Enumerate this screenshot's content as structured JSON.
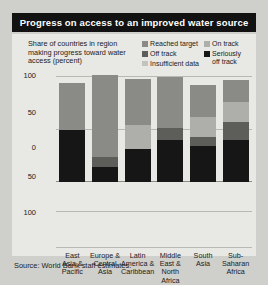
{
  "title": "Progress on access to an improved water source",
  "subtitle": "Share of countries in region making progress toward water access (percent)",
  "source": "Source: World Bank staff estimates.",
  "legend": {
    "left": [
      {
        "label": "Reached target",
        "key": "reached_target",
        "color": "#8a8a86"
      },
      {
        "label": "Off track",
        "key": "off_track",
        "color": "#5d5d5a"
      },
      {
        "label": "Insufficient data",
        "key": "insufficient_data",
        "color": "#c2c2be"
      }
    ],
    "right": [
      {
        "label": "On track",
        "key": "on_track",
        "color": "#aeaeaa"
      },
      {
        "label": "Seriously\noff track",
        "key": "seriously_off_track",
        "color": "#161616"
      }
    ]
  },
  "axis": {
    "ticks": [
      "100",
      "50",
      "0",
      "50",
      "100"
    ],
    "unit": "percent"
  },
  "chart_data": {
    "type": "bar",
    "title": "Progress on access to an improved water source",
    "subtitle": "Share of countries in region making progress toward water access (percent)",
    "xlabel": "",
    "ylabel": "Share of countries in region making progress toward water access (percent)",
    "ylim": [
      0,
      100
    ],
    "ytick_labels": [
      "100",
      "50",
      "0",
      "50",
      "100"
    ],
    "grid": true,
    "stacked": true,
    "legend_position": "top-right",
    "categories": [
      "East Asia & Pacific",
      "Europe & Central Asia",
      "Latin America & Caribbean",
      "Middle East & North Africa",
      "South Asia",
      "Sub-Saharan Africa"
    ],
    "series": [
      {
        "name": "Seriously off track",
        "color": "#161616",
        "values": [
          50,
          14,
          31,
          40,
          34,
          40
        ]
      },
      {
        "name": "Off track",
        "color": "#5d5d5a",
        "values": [
          0,
          10,
          0,
          11,
          9,
          17
        ]
      },
      {
        "name": "On track",
        "color": "#aeaeaa",
        "values": [
          0,
          0,
          23,
          0,
          19,
          19
        ]
      },
      {
        "name": "Reached target",
        "color": "#8a8a86",
        "values": [
          44,
          78,
          44,
          49,
          30,
          21
        ]
      }
    ]
  },
  "categories_display": [
    "East\nAsia &\nPacific",
    "Europe &\nCentral\nAsia",
    "Latin\nAmerica &\nCaribbean",
    "Middle\nEast &\nNorth\nAfrica",
    "South\nAsia",
    "Sub-\nSaharan\nAfrica"
  ]
}
